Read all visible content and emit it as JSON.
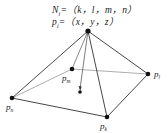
{
  "formulas": {
    "normal": {
      "symbol": "N",
      "sub": "i",
      "expr": "=（k，l，m，n）"
    },
    "point": {
      "symbol": "p",
      "sub": "i",
      "expr": "=（x，y，z）"
    }
  },
  "diagram": {
    "type": "pyramid",
    "apex": {
      "x": 88,
      "y": 31
    },
    "vertices": [
      {
        "id": "m",
        "label": "p",
        "sub": "m",
        "x": 72,
        "y": 69,
        "hidden": true
      },
      {
        "id": "l",
        "label": "p",
        "sub": "l",
        "x": 148,
        "y": 74
      },
      {
        "id": "n",
        "label": "p",
        "sub": "n",
        "x": 12,
        "y": 98
      },
      {
        "id": "k",
        "label": "p",
        "sub": "k",
        "x": 107,
        "y": 117
      }
    ],
    "inner_point": {
      "x": 80,
      "y": 91
    },
    "line_color": "#333333",
    "hidden_line_color": "#777777"
  }
}
